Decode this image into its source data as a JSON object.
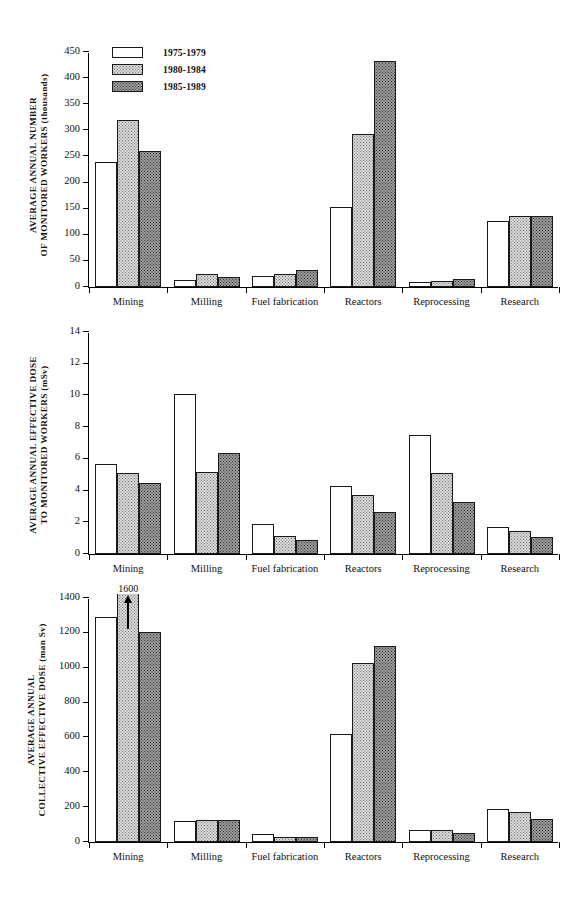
{
  "legend": {
    "items": [
      {
        "label": "1975-1979",
        "fill": "white"
      },
      {
        "label": "1980-1984",
        "fill": "light"
      },
      {
        "label": "1985-1989",
        "fill": "dark"
      }
    ]
  },
  "categories": [
    "Mining",
    "Milling",
    "Fuel fabrication",
    "Reactors",
    "Reprocessing",
    "Research"
  ],
  "chart_data": [
    {
      "type": "bar",
      "title": "",
      "ylabel": "AVERAGE ANNUAL NUMBER OF MONITORED WORKERS (thousands)",
      "ylabel_line1": "AVERAGE ANNUAL NUMBER",
      "ylabel_line2": "OF MONITORED WORKERS (thousands)",
      "xlabel": "",
      "ylim": [
        0,
        450
      ],
      "yticks": [
        0,
        50,
        100,
        150,
        200,
        250,
        300,
        350,
        400,
        450
      ],
      "grid": false,
      "legend_position": "top-left-inside",
      "categories": [
        "Mining",
        "Milling",
        "Fuel fabrication",
        "Reactors",
        "Reprocessing",
        "Research"
      ],
      "series": [
        {
          "name": "1975-1979",
          "values": [
            240,
            13,
            22,
            153,
            9,
            126
          ]
        },
        {
          "name": "1980-1984",
          "values": [
            320,
            24,
            24,
            293,
            12,
            136
          ]
        },
        {
          "name": "1985-1989",
          "values": [
            260,
            20,
            32,
            433,
            16,
            136
          ]
        }
      ]
    },
    {
      "type": "bar",
      "title": "",
      "ylabel": "AVERAGE ANNUAL EFFECTIVE DOSE TO MONITORED WORKERS (mSv)",
      "ylabel_line1": "AVERAGE ANNUAL  EFFECTIVE DOSE",
      "ylabel_line2": "TO MONITORED WORKERS (mSv)",
      "xlabel": "",
      "ylim": [
        0,
        14
      ],
      "yticks": [
        0,
        2,
        4,
        6,
        8,
        10,
        12,
        14
      ],
      "grid": false,
      "legend_position": "none",
      "categories": [
        "Mining",
        "Milling",
        "Fuel fabrication",
        "Reactors",
        "Reprocessing",
        "Research"
      ],
      "series": [
        {
          "name": "1975-1979",
          "values": [
            5.7,
            10.1,
            1.9,
            4.3,
            7.5,
            1.7
          ]
        },
        {
          "name": "1980-1984",
          "values": [
            5.1,
            5.2,
            1.15,
            3.7,
            5.1,
            1.45
          ]
        },
        {
          "name": "1985-1989",
          "values": [
            4.5,
            6.35,
            0.9,
            2.65,
            3.25,
            1.1
          ]
        }
      ]
    },
    {
      "type": "bar",
      "title": "",
      "ylabel": "AVERAGE ANNUAL COLLECTIVE EFFECTIVE DOSE (man Sv)",
      "ylabel_line1": "AVERAGE  ANNUAL",
      "ylabel_line2": "COLLECTIVE EFFECTIVE DOSE (man Sv)",
      "xlabel": "",
      "ylim": [
        0,
        1400
      ],
      "yticks": [
        0,
        200,
        400,
        600,
        800,
        1000,
        1200,
        1400
      ],
      "grid": false,
      "legend_position": "none",
      "categories": [
        "Mining",
        "Milling",
        "Fuel fabrication",
        "Reactors",
        "Reprocessing",
        "Research"
      ],
      "series": [
        {
          "name": "1975-1979",
          "values": [
            1290,
            122,
            48,
            620,
            70,
            192
          ]
        },
        {
          "name": "1980-1984",
          "values": [
            1600,
            125,
            30,
            1025,
            68,
            172
          ]
        },
        {
          "name": "1985-1989",
          "values": [
            1205,
            128,
            28,
            1125,
            52,
            132
          ]
        }
      ],
      "annotations": [
        {
          "text": "1600",
          "category": "Mining",
          "series": "1980-1984",
          "kind": "clipped-bar-arrow"
        }
      ]
    }
  ]
}
